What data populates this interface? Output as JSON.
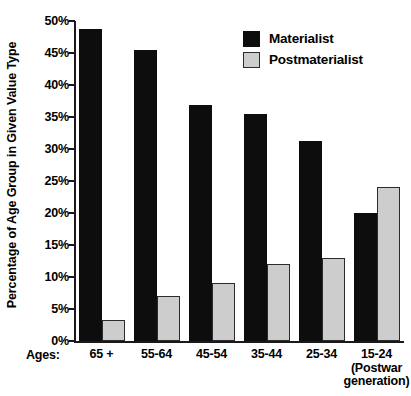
{
  "chart_data": {
    "type": "bar",
    "title": "",
    "xlabel": "Ages:",
    "ylabel": "Percentage of Age Group in Given Value Type",
    "ylim": [
      0,
      50
    ],
    "yticks": [
      "0%",
      "5%",
      "10%",
      "15%",
      "20%",
      "25%",
      "30%",
      "35%",
      "40%",
      "45%",
      "50%"
    ],
    "ytick_values": [
      0,
      5,
      10,
      15,
      20,
      25,
      30,
      35,
      40,
      45,
      50
    ],
    "grid": false,
    "legend_position": "top-right",
    "categories": [
      "65 +",
      "55-64",
      "45-54",
      "35-44",
      "25-34",
      "15-24"
    ],
    "category_sublabels": [
      "",
      "",
      "",
      "",
      "",
      "(Postwar generation)"
    ],
    "series": [
      {
        "name": "Materialist",
        "color": "#0d0d0d",
        "values": [
          48.7,
          45.5,
          36.8,
          35.4,
          31.2,
          20.0
        ]
      },
      {
        "name": "Postmaterialist",
        "color": "#cdcdcd",
        "values": [
          3.3,
          7.0,
          9.0,
          12.0,
          13.0,
          24.0
        ]
      }
    ]
  },
  "axis": {
    "ages_caption": "Ages:"
  },
  "legend": {
    "items": [
      {
        "label": "Materialist",
        "swatch": "black-square-icon"
      },
      {
        "label": "Postmaterialist",
        "swatch": "gray-square-icon"
      }
    ]
  },
  "colors": {
    "materialist": "#0d0d0d",
    "postmaterialist": "#cdcdcd",
    "axis": "#1a1a1a",
    "background": "#ffffff"
  }
}
